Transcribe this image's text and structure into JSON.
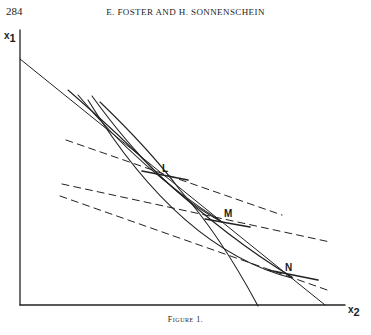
{
  "header": {
    "page_number": "284",
    "running_head": "E. FOSTER AND H. SONNENSCHEIN"
  },
  "figure": {
    "caption": "Figure 1.",
    "axes": {
      "y_label_base": "x",
      "y_label_sub": "1",
      "x_label_base": "x",
      "x_label_sub": "2"
    },
    "points": [
      {
        "label": "L"
      },
      {
        "label": "M"
      },
      {
        "label": "N"
      }
    ],
    "colors": {
      "ink": "#222222",
      "background": "#ffffff"
    }
  }
}
